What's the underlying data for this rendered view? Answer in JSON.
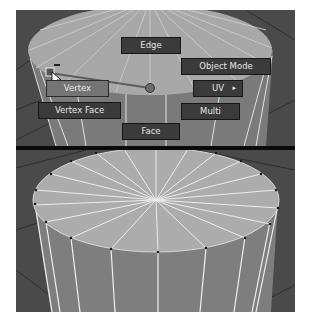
{
  "viewport": {
    "title": "Selection mode marking menu over cylinder",
    "colors": {
      "background": "#4a4a4a",
      "grid_line": "#2e2e2e",
      "cylinder_top": "#a8a8a8",
      "cylinder_side": "#7a7a7a",
      "wire": "#e8e8e8",
      "button_bg": "#3b3b3b",
      "button_active_bg": "#747474",
      "button_text": "#e6e6e6",
      "divider": "#0a0a0a"
    }
  },
  "marking_menu": {
    "north": {
      "label": "Edge"
    },
    "north_east": {
      "label": "Object Mode"
    },
    "east": {
      "label": "UV",
      "submenu_icon": "▸"
    },
    "south_east": {
      "label": "Multi"
    },
    "south": {
      "label": "Face"
    },
    "south_west": {
      "label": "Vertex Face"
    },
    "west": {
      "label": "Vertex",
      "active": true
    }
  },
  "lower_view": {
    "description": "Cylinder with vertex selection mode active",
    "radial_segments": 20
  }
}
